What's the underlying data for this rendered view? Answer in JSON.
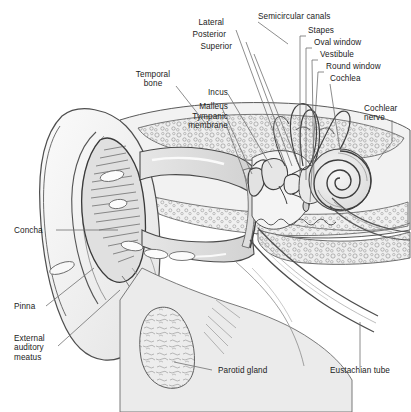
{
  "figure": {
    "background_color": "#ffffff",
    "label_color": "#1b1b1b",
    "leader_line_color": "#6f6f6f",
    "outline_color": "#555555",
    "bone_fill": "#e8e8e8",
    "soft_tissue_fill": "#d9d9d9",
    "cartilage_fill": "#efefef",
    "width": 411,
    "height": 412
  },
  "labels": {
    "lateral": "Lateral",
    "posterior": "Posterior",
    "superior": "Superior",
    "semicircular_canals": "Semicircular canals",
    "stapes": "Stapes",
    "oval_window": "Oval window",
    "vestibule": "Vestibule",
    "round_window": "Round window",
    "cochlea": "Cochlea",
    "cochlear_nerve": "Cochlear\nnerve",
    "temporal_bone": "Temporal\nbone",
    "incus": "Incus",
    "malleus": "Malleus",
    "tympanic_membrane": "Tympanic\nmembrane",
    "concha": "Concha",
    "pinna": "Pinna",
    "external_auditory_meatus": "External\nauditory\nmeatus",
    "parotid_gland": "Parotid gland",
    "eustachian_tube": "Eustachian tube"
  },
  "structures": [
    {
      "name": "pinna",
      "region": "outer ear"
    },
    {
      "name": "concha",
      "region": "outer ear"
    },
    {
      "name": "external-auditory-meatus",
      "region": "outer ear"
    },
    {
      "name": "tympanic-membrane",
      "region": "middle ear"
    },
    {
      "name": "malleus",
      "region": "middle ear"
    },
    {
      "name": "incus",
      "region": "middle ear"
    },
    {
      "name": "stapes",
      "region": "middle ear"
    },
    {
      "name": "oval-window",
      "region": "middle ear"
    },
    {
      "name": "round-window",
      "region": "middle ear"
    },
    {
      "name": "eustachian-tube",
      "region": "middle ear"
    },
    {
      "name": "semicircular-canals",
      "region": "inner ear"
    },
    {
      "name": "vestibule",
      "region": "inner ear"
    },
    {
      "name": "cochlea",
      "region": "inner ear"
    },
    {
      "name": "cochlear-nerve",
      "region": "inner ear"
    },
    {
      "name": "temporal-bone",
      "region": "skull"
    },
    {
      "name": "parotid-gland",
      "region": "gland"
    }
  ]
}
